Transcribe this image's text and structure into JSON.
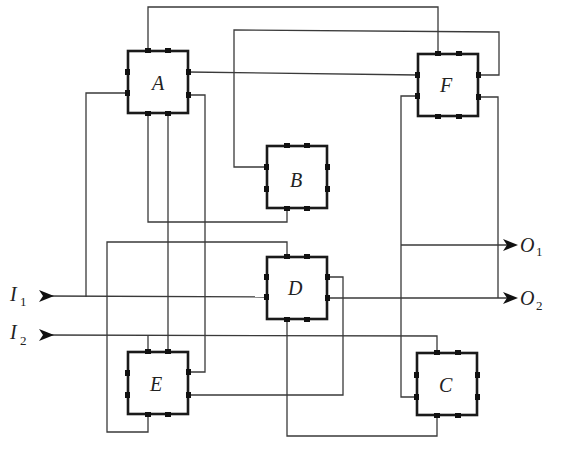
{
  "diagram": {
    "type": "block-interconnection-network",
    "blocks": [
      {
        "id": "A",
        "label": "A"
      },
      {
        "id": "B",
        "label": "B"
      },
      {
        "id": "C",
        "label": "C"
      },
      {
        "id": "D",
        "label": "D"
      },
      {
        "id": "E",
        "label": "E"
      },
      {
        "id": "F",
        "label": "F"
      }
    ],
    "inputs": [
      {
        "id": "I1",
        "label": "I",
        "subscript": "1"
      },
      {
        "id": "I2",
        "label": "I",
        "subscript": "2"
      }
    ],
    "outputs": [
      {
        "id": "O1",
        "label": "O",
        "subscript": "1"
      },
      {
        "id": "O2",
        "label": "O",
        "subscript": "2"
      }
    ],
    "connections": [
      {
        "from": "A.top-left",
        "to": "F.top-left"
      },
      {
        "from": "B.left-top",
        "to": "F.right-top"
      },
      {
        "from": "A.right-top",
        "to": "F.left-top"
      },
      {
        "from": "A.left-bottom",
        "to": "I1"
      },
      {
        "from": "A.bottom-left",
        "to": "B.bottom-left"
      },
      {
        "from": "A.bottom-right",
        "to": "E.top-right"
      },
      {
        "from": "A.right-bottom",
        "to": "E.right-top"
      },
      {
        "from": "D.top-left",
        "to": "E.bottom-left"
      },
      {
        "from": "I1",
        "to": "D.left-bottom"
      },
      {
        "from": "I2",
        "to": "C.top-left"
      },
      {
        "from": "E.top-left",
        "to": "I2"
      },
      {
        "from": "D.right-top",
        "to": "E.right-bottom"
      },
      {
        "from": "D.right-bottom",
        "to": "O2"
      },
      {
        "from": "D.bottom-left",
        "to": "C.bottom-left"
      },
      {
        "from": "F.left-bottom",
        "to": "C.left-bottom"
      },
      {
        "from": "F.left-bottom",
        "to": "O1"
      },
      {
        "from": "F.right-bottom",
        "to": "O2"
      }
    ]
  }
}
